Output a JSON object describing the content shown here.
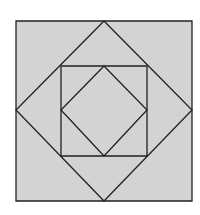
{
  "diagram": {
    "type": "nested-squares",
    "colors": {
      "background": "#ffffff",
      "fill": "#d3d3d3",
      "stroke": "#222222"
    },
    "shapes": [
      {
        "name": "outer-square",
        "points": [
          [
            16,
            21
          ],
          [
            192,
            21
          ],
          [
            192,
            201
          ],
          [
            16,
            201
          ]
        ]
      },
      {
        "name": "outer-diamond",
        "points": [
          [
            104,
            21
          ],
          [
            192,
            110
          ],
          [
            104,
            201
          ],
          [
            16,
            110
          ]
        ]
      },
      {
        "name": "inner-square",
        "points": [
          [
            61,
            66
          ],
          [
            147,
            66
          ],
          [
            147,
            156
          ],
          [
            61,
            156
          ]
        ]
      },
      {
        "name": "inner-diamond",
        "points": [
          [
            104,
            66
          ],
          [
            147,
            110
          ],
          [
            104,
            156
          ],
          [
            61,
            110
          ]
        ]
      }
    ]
  }
}
